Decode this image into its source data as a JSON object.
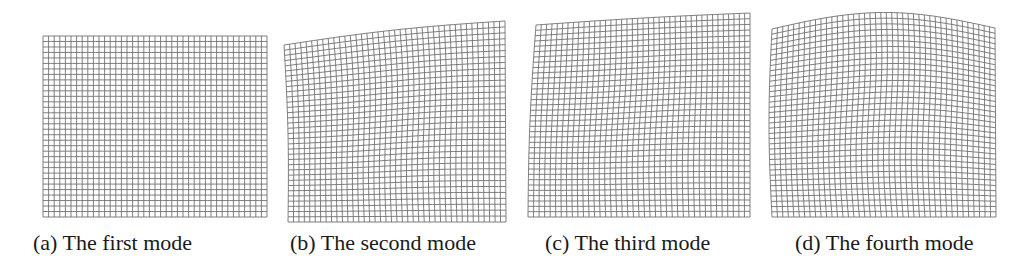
{
  "figure": {
    "panels": [
      {
        "id": "a",
        "caption": "(a) The first mode",
        "caption_x": 33,
        "mesh": {
          "cols": 40,
          "rows": 33,
          "top_left": [
            43,
            36
          ],
          "top_right": [
            267,
            36
          ],
          "bottom_left": [
            43,
            217
          ],
          "bottom_right": [
            267,
            217
          ],
          "top_bulge": 0,
          "left_bow": 0,
          "right_bow": 0,
          "interior_wave": 0
        }
      },
      {
        "id": "b",
        "caption": "(b) The second mode",
        "caption_x": 290,
        "mesh": {
          "cols": 40,
          "rows": 34,
          "top_left": [
            284,
            45
          ],
          "top_right": [
            505,
            21
          ],
          "bottom_left": [
            288,
            222
          ],
          "bottom_right": [
            506,
            222
          ],
          "top_bulge": 3,
          "left_bow": -2,
          "right_bow": 0,
          "interior_wave": 1.5
        }
      },
      {
        "id": "c",
        "caption": "(c) The third mode",
        "caption_x": 545,
        "mesh": {
          "cols": 40,
          "rows": 36,
          "top_left": [
            536,
            25
          ],
          "top_right": [
            750,
            13
          ],
          "bottom_left": [
            528,
            217
          ],
          "bottom_right": [
            750,
            217
          ],
          "top_bulge": 1,
          "left_bow": 2,
          "right_bow": 0,
          "interior_wave": 1.5
        }
      },
      {
        "id": "d",
        "caption": "(d) The fourth mode",
        "caption_x": 795,
        "mesh": {
          "cols": 41,
          "rows": 36,
          "top_left": [
            772,
            29
          ],
          "top_right": [
            995,
            28
          ],
          "bottom_left": [
            772,
            217
          ],
          "bottom_right": [
            996,
            217
          ],
          "top_bulge": 16,
          "left_bow": 3,
          "right_bow": 0,
          "interior_wave": 2
        }
      }
    ],
    "colors": {
      "mesh_line": "#707070",
      "caption_text": "#1a1a1a",
      "background": "#ffffff"
    }
  }
}
